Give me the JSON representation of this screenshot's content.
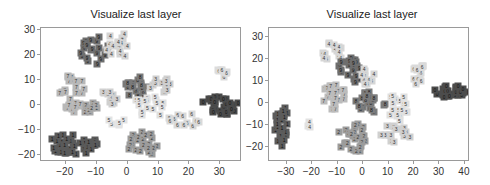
{
  "chart_data": [
    {
      "type": "scatter",
      "title": "Visualize last layer",
      "xlabel": "",
      "ylabel": "",
      "xlim": [
        -28,
        37
      ],
      "ylim": [
        -23,
        31
      ],
      "xticks": [
        -20,
        -10,
        0,
        10,
        20,
        30
      ],
      "yticks": [
        30,
        20,
        10,
        0,
        -10,
        -20
      ],
      "grid": false,
      "legend": "none",
      "clusters": [
        {
          "label": "1",
          "gray": "#5a5a5a",
          "cx": -18,
          "cy": -16,
          "rx": 9,
          "ry": 4,
          "n": 40
        },
        {
          "label": "9",
          "gray": "#6e6e6e",
          "cx": -11,
          "cy": 22,
          "rx": 5,
          "ry": 6,
          "n": 22
        },
        {
          "label": "4",
          "gray": "#d4d4d4",
          "cx": -3,
          "cy": 24,
          "rx": 4,
          "ry": 6,
          "n": 16
        },
        {
          "label": "7",
          "gray": "#b8b8b8",
          "cx": -18,
          "cy": 5,
          "rx": 4,
          "ry": 8,
          "n": 26
        },
        {
          "label": "8",
          "gray": "#7a7a7a",
          "cx": 3,
          "cy": 7,
          "rx": 4,
          "ry": 5,
          "n": 18
        },
        {
          "label": "3",
          "gray": "#cfcfcf",
          "cx": 12,
          "cy": 8,
          "rx": 5,
          "ry": 3,
          "n": 14
        },
        {
          "label": "5",
          "gray": "#e0e0e0",
          "cx": 8,
          "cy": 0,
          "rx": 6,
          "ry": 5,
          "n": 16
        },
        {
          "label": "2",
          "gray": "#9c9c9c",
          "cx": 5,
          "cy": -16,
          "rx": 6,
          "ry": 5,
          "n": 24
        },
        {
          "label": "6",
          "gray": "#d9d9d9",
          "cx": 18,
          "cy": -6,
          "rx": 6,
          "ry": 3,
          "n": 14
        },
        {
          "label": "0",
          "gray": "#4a4a4a",
          "cx": 30,
          "cy": 0,
          "rx": 6,
          "ry": 4,
          "n": 28
        },
        {
          "label": "6",
          "gray": "#dcdcdc",
          "cx": 30,
          "cy": 13,
          "rx": 3,
          "ry": 2,
          "n": 8
        },
        {
          "label": "2",
          "gray": "#a8a8a8",
          "cx": -12,
          "cy": -2,
          "rx": 5,
          "ry": 3,
          "n": 10
        },
        {
          "label": "3",
          "gray": "#d0d0d0",
          "cx": -6,
          "cy": 2,
          "rx": 3,
          "ry": 4,
          "n": 10
        },
        {
          "label": "5",
          "gray": "#e3e3e3",
          "cx": -4,
          "cy": -7,
          "rx": 3,
          "ry": 2,
          "n": 6
        }
      ]
    },
    {
      "type": "scatter",
      "title": "Visualize last layer",
      "xlabel": "",
      "ylabel": "",
      "xlim": [
        -37,
        42
      ],
      "ylim": [
        -27,
        34
      ],
      "xticks": [
        -30,
        -20,
        -10,
        0,
        10,
        20,
        30,
        40
      ],
      "yticks": [
        30,
        20,
        10,
        0,
        -10,
        -20
      ],
      "grid": false,
      "legend": "none",
      "clusters": [
        {
          "label": "1",
          "gray": "#5c5c5c",
          "cx": -32,
          "cy": -10,
          "rx": 3,
          "ry": 10,
          "n": 30
        },
        {
          "label": "4",
          "gray": "#d6d6d6",
          "cx": -12,
          "cy": 22,
          "rx": 4,
          "ry": 6,
          "n": 14
        },
        {
          "label": "9",
          "gray": "#6e6e6e",
          "cx": -5,
          "cy": 15,
          "rx": 5,
          "ry": 6,
          "n": 22
        },
        {
          "label": "4",
          "gray": "#d6d6d6",
          "cx": 2,
          "cy": 12,
          "rx": 3,
          "ry": 4,
          "n": 10
        },
        {
          "label": "7",
          "gray": "#bcbcbc",
          "cx": -12,
          "cy": 3,
          "rx": 5,
          "ry": 6,
          "n": 22
        },
        {
          "label": "8",
          "gray": "#7c7c7c",
          "cx": 3,
          "cy": 0,
          "rx": 6,
          "ry": 5,
          "n": 22
        },
        {
          "label": "2",
          "gray": "#9c9c9c",
          "cx": -4,
          "cy": -16,
          "rx": 6,
          "ry": 7,
          "n": 28
        },
        {
          "label": "5",
          "gray": "#e0e0e0",
          "cx": 14,
          "cy": -2,
          "rx": 4,
          "ry": 8,
          "n": 18
        },
        {
          "label": "3",
          "gray": "#d0d0d0",
          "cx": 13,
          "cy": -14,
          "rx": 6,
          "ry": 4,
          "n": 16
        },
        {
          "label": "6",
          "gray": "#dadada",
          "cx": 22,
          "cy": 13,
          "rx": 3,
          "ry": 6,
          "n": 14
        },
        {
          "label": "0",
          "gray": "#4c4c4c",
          "cx": 35,
          "cy": 5,
          "rx": 7,
          "ry": 3,
          "n": 24
        },
        {
          "label": "4",
          "gray": "#e2e2e2",
          "cx": -21,
          "cy": -10,
          "rx": 1,
          "ry": 2,
          "n": 3
        }
      ]
    }
  ],
  "panels": [
    {
      "title": "Visualize last layer",
      "yticks": [
        "30",
        "20",
        "10",
        "0",
        "−10",
        "−20"
      ],
      "xticks": [
        "−20",
        "−10",
        "0",
        "10",
        "20",
        "30"
      ]
    },
    {
      "title": "Visualize last layer",
      "yticks": [
        "30",
        "20",
        "10",
        "0",
        "−10",
        "−20"
      ],
      "xticks": [
        "−30",
        "−20",
        "−10",
        "0",
        "10",
        "20",
        "30",
        "40"
      ]
    }
  ]
}
